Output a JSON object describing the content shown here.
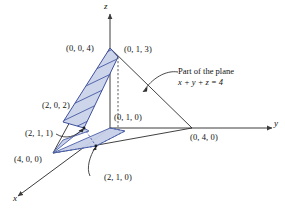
{
  "figure": {
    "axes": [
      {
        "name": "x-axis",
        "label": "x"
      },
      {
        "name": "y-axis",
        "label": "y"
      },
      {
        "name": "z-axis",
        "label": "z"
      }
    ],
    "annotation": {
      "line1": "Part of the plane",
      "line2": "x + y + z = 4"
    },
    "point_labels": [
      {
        "name": "point-0-0-4",
        "text": "(0, 0, 4)"
      },
      {
        "name": "point-0-1-3",
        "text": "(0, 1, 3)"
      },
      {
        "name": "point-2-0-2",
        "text": "(2, 0, 2)"
      },
      {
        "name": "point-0-1-0",
        "text": "(0, 1, 0)"
      },
      {
        "name": "point-2-1-1",
        "text": "(2, 1, 1)"
      },
      {
        "name": "point-0-4-0",
        "text": "(0, 4, 0)"
      },
      {
        "name": "point-4-0-0",
        "text": "(4, 0, 0)"
      },
      {
        "name": "point-2-1-0",
        "text": "(2, 1, 0)"
      }
    ],
    "colors": {
      "region_fill": "#c7d0e8",
      "region_stroke": "#3f51a0",
      "axis": "#3c3c3c",
      "text": "#111111"
    }
  }
}
